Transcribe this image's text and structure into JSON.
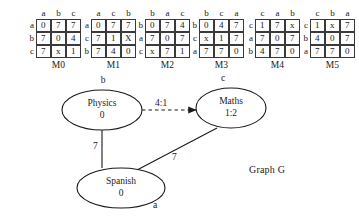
{
  "matrices": [
    {
      "caption": "M0",
      "columns": [
        "a",
        "b",
        "c"
      ],
      "rows": [
        "a",
        "b",
        "c"
      ],
      "cells": [
        [
          "0",
          "7",
          "7"
        ],
        [
          "7",
          "0",
          "4"
        ],
        [
          "7",
          "x",
          "1"
        ]
      ],
      "left": 27
    },
    {
      "caption": "M1",
      "columns": [
        "a",
        "c",
        "b"
      ],
      "rows": [
        "a",
        "c",
        "b"
      ],
      "cells": [
        [
          "0",
          "7",
          "7"
        ],
        [
          "7",
          "1",
          "X"
        ],
        [
          "7",
          "4",
          "0"
        ]
      ],
      "left": 82
    },
    {
      "caption": "M2",
      "columns": [
        "b",
        "a",
        "c"
      ],
      "rows": [
        "b",
        "a",
        "c"
      ],
      "cells": [
        [
          "0",
          "7",
          "4"
        ],
        [
          "7",
          "0",
          "7"
        ],
        [
          "x",
          "7",
          "1"
        ]
      ],
      "left": 136
    },
    {
      "caption": "M3",
      "columns": [
        "b",
        "c",
        "a"
      ],
      "rows": [
        "b",
        "c",
        "a"
      ],
      "cells": [
        [
          "0",
          "4",
          "7"
        ],
        [
          "x",
          "1",
          "7"
        ],
        [
          "7",
          "7",
          "0"
        ]
      ],
      "left": 190
    },
    {
      "caption": "M4",
      "columns": [
        "c",
        "a",
        "b"
      ],
      "rows": [
        "c",
        "a",
        "b"
      ],
      "cells": [
        [
          "1",
          "7",
          "x"
        ],
        [
          "7",
          "0",
          "7"
        ],
        [
          "4",
          "7",
          "0"
        ]
      ],
      "left": 246
    },
    {
      "caption": "M5",
      "columns": [
        "c",
        "b",
        "a"
      ],
      "rows": [
        "c",
        "b",
        "a"
      ],
      "cells": [
        [
          "1",
          "x",
          "7"
        ],
        [
          "4",
          "0",
          "7"
        ],
        [
          "7",
          "7",
          "0"
        ]
      ],
      "left": 301
    }
  ],
  "graph": {
    "caption": "Graph G",
    "nodes": {
      "physics": {
        "name": "Physics",
        "value": "0",
        "key": "b"
      },
      "maths": {
        "name": "Maths",
        "value": "1:2",
        "key": "c"
      },
      "spanish": {
        "name": "Spanish",
        "value": "0",
        "key": "a"
      }
    },
    "edges": {
      "physics_maths": {
        "weight": "4:1",
        "style": "dashed-arrow"
      },
      "physics_spanish": {
        "weight": "7",
        "style": "solid"
      },
      "spanish_maths": {
        "weight": "7",
        "style": "solid"
      }
    }
  },
  "colors": {
    "ink": "#1a1a1a",
    "stroke": "#3a3a3a",
    "background": "#ffffff"
  }
}
